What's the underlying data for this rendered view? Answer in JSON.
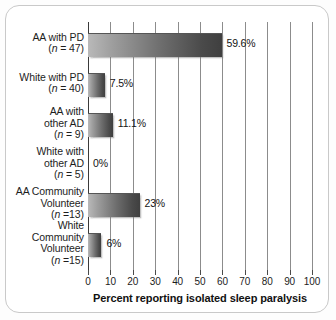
{
  "chart_data": {
    "type": "bar",
    "orientation": "horizontal",
    "title": "",
    "xlabel": "Percent reporting isolated sleep paralysis",
    "ylabel": "",
    "xlim": [
      0,
      100
    ],
    "xticks": [
      0,
      10,
      20,
      30,
      40,
      50,
      60,
      70,
      80,
      90,
      100
    ],
    "xtick_labels": [
      "0",
      "10",
      "20",
      "30",
      "40",
      "50",
      "60",
      "70",
      "80",
      "90",
      "100"
    ],
    "grid": true,
    "legend": false,
    "categories": [
      "AA with PD (n = 47)",
      "White with PD (n = 40)",
      "AA with other AD (n = 9)",
      "White with other AD (n = 5)",
      "AA Community Volunteer (n =13)",
      "White Community Volunteer (n =15)"
    ],
    "values": [
      59.6,
      7.5,
      11.1,
      0,
      23,
      6
    ],
    "value_labels": [
      "59.6%",
      "7.5%",
      "11.1%",
      "0%",
      "23%",
      "6%"
    ],
    "bars": [
      {
        "label_lines": [
          "AA with PD"
        ],
        "n_text": "(n = 47)",
        "n_prefix": "(",
        "n_italic": "n",
        "n_suffix": " = 47)",
        "value": 59.6,
        "value_label": "59.6%"
      },
      {
        "label_lines": [
          "White with PD"
        ],
        "n_text": "(n = 40)",
        "n_prefix": "(",
        "n_italic": "n",
        "n_suffix": " = 40)",
        "value": 7.5,
        "value_label": "7.5%"
      },
      {
        "label_lines": [
          "AA with",
          "other AD"
        ],
        "n_text": "(n = 9)",
        "n_prefix": "(",
        "n_italic": "n",
        "n_suffix": " = 9)",
        "value": 11.1,
        "value_label": "11.1%"
      },
      {
        "label_lines": [
          "White with",
          "other AD"
        ],
        "n_text": "(n = 5)",
        "n_prefix": "(",
        "n_italic": "n",
        "n_suffix": " = 5)",
        "value": 0,
        "value_label": "0%"
      },
      {
        "label_lines": [
          "AA Community",
          "Volunteer"
        ],
        "n_text": "(n =13)",
        "n_prefix": "(",
        "n_italic": "n",
        "n_suffix": " =13)",
        "value": 23,
        "value_label": "23%"
      },
      {
        "label_lines": [
          "White",
          "Community",
          "Volunteer"
        ],
        "n_text": "(n =15)",
        "n_prefix": "(",
        "n_italic": "n",
        "n_suffix": " =15)",
        "value": 6,
        "value_label": "6%"
      }
    ],
    "colors": {
      "bar_gradient_light": "#b9b9b9",
      "bar_gradient_dark": "#3f3f3f",
      "gridline": "#8c8c8c",
      "axis": "#3a3a3a",
      "text": "#1d1d1d",
      "background": "#ffffff",
      "frame_border": "#c9c9c9"
    }
  }
}
